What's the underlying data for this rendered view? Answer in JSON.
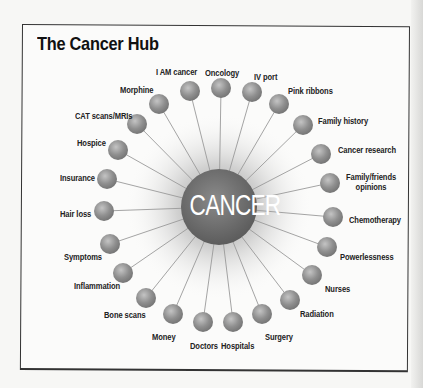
{
  "title": "The Cancer Hub",
  "center": {
    "label": "CANCER",
    "x": 219,
    "y": 207,
    "r": 38
  },
  "colors": {
    "node": "#8f8f8f",
    "node_highlight": "#c4c4c4",
    "center": "#6a6a6a",
    "spoke": "#9a9a9a",
    "frame": "#333333"
  },
  "nodes": [
    {
      "label": "Oncology",
      "x": 221,
      "y": 88,
      "lx": 205,
      "ly": 68
    },
    {
      "label": "IV port",
      "x": 252,
      "y": 92,
      "lx": 254,
      "ly": 72
    },
    {
      "label": "Pink ribbons",
      "x": 279,
      "y": 104,
      "lx": 288,
      "ly": 86
    },
    {
      "label": "Family history",
      "x": 303,
      "y": 125,
      "lx": 318,
      "ly": 116
    },
    {
      "label": "Cancer research",
      "x": 321,
      "y": 154,
      "lx": 338,
      "ly": 145
    },
    {
      "label": "Family/friends\nopinions",
      "x": 330,
      "y": 183,
      "lx": 346,
      "ly": 172
    },
    {
      "label": "Chemotherapy",
      "x": 333,
      "y": 217,
      "lx": 349,
      "ly": 215
    },
    {
      "label": "Powerlessness",
      "x": 327,
      "y": 247,
      "lx": 340,
      "ly": 252
    },
    {
      "label": "Nurses",
      "x": 312,
      "y": 275,
      "lx": 325,
      "ly": 284
    },
    {
      "label": "Radiation",
      "x": 290,
      "y": 300,
      "lx": 300,
      "ly": 309
    },
    {
      "label": "Surgery",
      "x": 262,
      "y": 314,
      "lx": 265,
      "ly": 332
    },
    {
      "label": "Hospitals",
      "x": 233,
      "y": 322,
      "lx": 221,
      "ly": 341
    },
    {
      "label": "Doctors",
      "x": 203,
      "y": 322,
      "lx": 190,
      "ly": 341
    },
    {
      "label": "Money",
      "x": 173,
      "y": 314,
      "lx": 152,
      "ly": 332
    },
    {
      "label": "Bone scans",
      "x": 146,
      "y": 298,
      "lx": 104,
      "ly": 310
    },
    {
      "label": "Inflammation",
      "x": 123,
      "y": 273,
      "lx": 74,
      "ly": 281
    },
    {
      "label": "Symptoms",
      "x": 110,
      "y": 244,
      "lx": 64,
      "ly": 252
    },
    {
      "label": "Hair loss",
      "x": 104,
      "y": 211,
      "lx": 60,
      "ly": 209
    },
    {
      "label": "Insurance",
      "x": 107,
      "y": 179,
      "lx": 60,
      "ly": 173
    },
    {
      "label": "Hospice",
      "x": 118,
      "y": 150,
      "lx": 77,
      "ly": 138
    },
    {
      "label": "CAT scans/MRIs",
      "x": 137,
      "y": 124,
      "lx": 75,
      "ly": 111
    },
    {
      "label": "Morphine",
      "x": 159,
      "y": 104,
      "lx": 120,
      "ly": 85
    },
    {
      "label": "I AM cancer",
      "x": 190,
      "y": 91,
      "lx": 156,
      "ly": 67
    }
  ]
}
